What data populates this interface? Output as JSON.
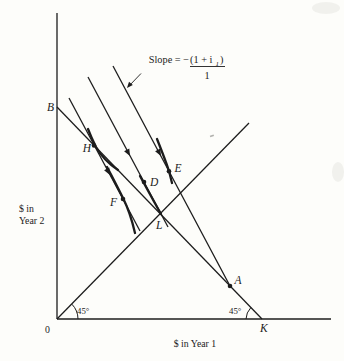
{
  "figure": {
    "background_color": "#fdfdfa",
    "ink_color": "#1c1c1c",
    "axis": {
      "origin_label": "0",
      "x_label": "$ in Year 1",
      "y_label_line1": "$ in",
      "y_label_line2": "Year 2"
    },
    "points": {
      "B": "B",
      "H": "H",
      "F": "F",
      "D": "D",
      "E": "E",
      "L": "L",
      "A": "A",
      "K": "K"
    },
    "angles": {
      "at_origin": "45°",
      "at_K": "45°"
    },
    "slope_annotation": {
      "prefix": "Slope = −",
      "numerator_main": "(1 + i",
      "numerator_subscript": "1",
      "numerator_close": ")",
      "denominator": "1"
    }
  }
}
